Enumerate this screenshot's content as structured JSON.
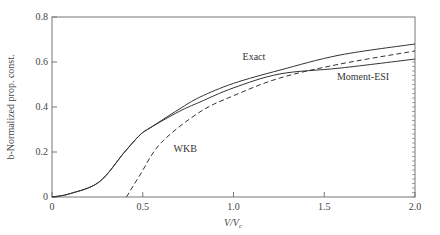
{
  "chart_data": {
    "type": "line",
    "title": "",
    "xlabel": "V/V_c",
    "xlabel_main": "V/V",
    "xlabel_sub": "c",
    "ylabel": "b-Normalized prop. const.",
    "xlim": [
      0,
      2.0
    ],
    "ylim": [
      0,
      0.8
    ],
    "grid": false,
    "legend": "inline labels",
    "x_ticks": [
      "0",
      "0.5",
      "1.0",
      "1.5",
      "2.0"
    ],
    "y_ticks": [
      "0",
      "0.2",
      "0.4",
      "0.6",
      "0.8"
    ],
    "series": [
      {
        "name": "Exact",
        "style": "solid",
        "x": [
          0,
          0.1,
          0.26,
          0.4,
          0.485,
          0.54,
          0.7,
          0.815,
          1.0,
          1.256,
          1.587,
          2.0
        ],
        "values": [
          0,
          0.015,
          0.067,
          0.2,
          0.276,
          0.307,
          0.39,
          0.444,
          0.505,
          0.564,
          0.631,
          0.68
        ]
      },
      {
        "name": "Moment-ESI",
        "style": "solid",
        "x": [
          0,
          0.1,
          0.26,
          0.4,
          0.485,
          0.54,
          0.7,
          0.815,
          1.0,
          1.256,
          1.587,
          2.0
        ],
        "values": [
          0,
          0.015,
          0.067,
          0.2,
          0.276,
          0.307,
          0.38,
          0.422,
          0.485,
          0.547,
          0.573,
          0.613
        ]
      },
      {
        "name": "WKB",
        "style": "dashed",
        "x": [
          0.41,
          0.485,
          0.6,
          0.815,
          1.0,
          1.256,
          1.587,
          2.0
        ],
        "values": [
          0,
          0.098,
          0.24,
          0.378,
          0.45,
          0.529,
          0.591,
          0.649
        ]
      }
    ],
    "annotations": [
      {
        "text": "Exact",
        "x": 1.05,
        "y": 0.61
      },
      {
        "text": "Moment-ESI",
        "x": 1.57,
        "y": 0.52
      },
      {
        "text": "WKB",
        "x": 0.67,
        "y": 0.2
      }
    ]
  }
}
